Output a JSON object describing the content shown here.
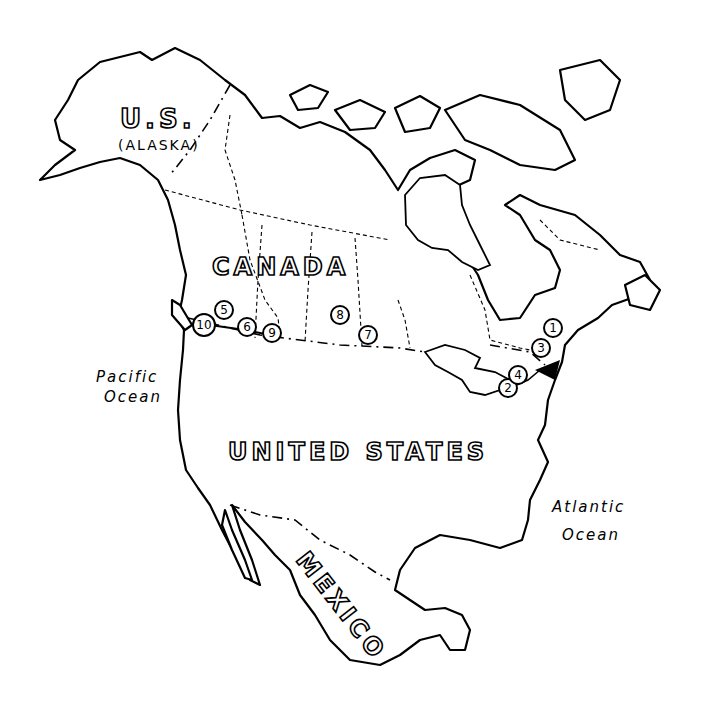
{
  "map": {
    "title": "North America outline map",
    "labels": {
      "alaska_line1": "U.S.",
      "alaska_line2": "(ALASKA)",
      "canada": "CANADA",
      "united_states": "UNITED STATES",
      "mexico": "MEXICO",
      "pacific_line1": "Pacific",
      "pacific_line2": "Ocean",
      "atlantic_line1": "Atlantic",
      "atlantic_line2": "Ocean"
    },
    "markers": [
      {
        "id": "1",
        "label": "1"
      },
      {
        "id": "2",
        "label": "2"
      },
      {
        "id": "3",
        "label": "3"
      },
      {
        "id": "4",
        "label": "4"
      },
      {
        "id": "5",
        "label": "5"
      },
      {
        "id": "6",
        "label": "6"
      },
      {
        "id": "7",
        "label": "7"
      },
      {
        "id": "8",
        "label": "8"
      },
      {
        "id": "9",
        "label": "9"
      },
      {
        "id": "10",
        "label": "10"
      }
    ],
    "arrow": {
      "label": "origin-arrow",
      "direction": "west"
    },
    "colors": {
      "line": "#000000",
      "background": "#ffffff"
    }
  }
}
